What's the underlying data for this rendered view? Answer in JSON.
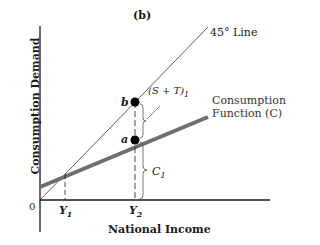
{
  "diagram": {
    "panel_label": "(b)",
    "x_axis_label": "National Income",
    "y_axis_label": "Consumption Demand",
    "origin_label": "0",
    "x_ticks": [
      {
        "label": "Y",
        "sub": "1"
      },
      {
        "label": "Y",
        "sub": "2"
      }
    ],
    "lines": {
      "line_45": {
        "label": "45° Line",
        "color": "#333333"
      },
      "consumption": {
        "label_line1": "Consumption",
        "label_line2": "Function (C)",
        "color": "#6e6e6e"
      }
    },
    "points": {
      "b": "b",
      "a": "a"
    },
    "braces": {
      "upper": {
        "label": "(S + T)",
        "sub": "1"
      },
      "lower": {
        "label": "C",
        "sub": "1"
      }
    }
  }
}
